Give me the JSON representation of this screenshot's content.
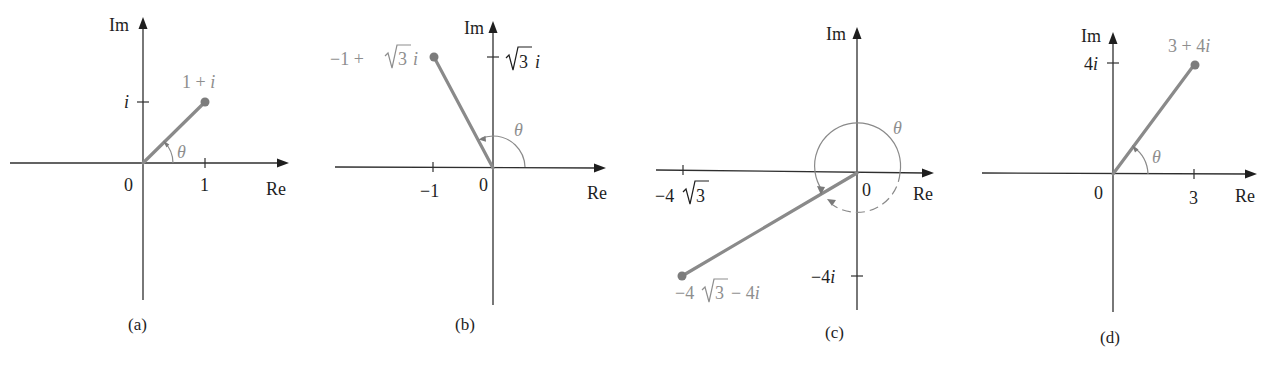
{
  "figure": {
    "colors": {
      "axis": "#2f2f2f",
      "vector": "#8a8a8a",
      "point": "#7c7c7c",
      "point_label": "#8e8e8e",
      "text": "#1e1e1e",
      "background": "#ffffff"
    },
    "axis_labels": {
      "real": "Re",
      "imaginary": "Im"
    },
    "angle_symbol": "θ",
    "panels": [
      {
        "caption": "(a)",
        "point_label": "1 + i",
        "complex_value": {
          "re": 1,
          "im": 1
        },
        "origin_label": "0",
        "re_tick_label": "1",
        "im_tick_label": "i"
      },
      {
        "caption": "(b)",
        "point_label_parts": [
          "−1 + ",
          "√",
          "3",
          " i"
        ],
        "complex_value": {
          "re": -1,
          "im": 1.732
        },
        "origin_label": "0",
        "re_tick_label": "−1",
        "im_tick_label_parts": [
          "√",
          "3",
          " i"
        ]
      },
      {
        "caption": "(c)",
        "point_label_parts": [
          "−4 ",
          "√",
          "3",
          " − 4i"
        ],
        "complex_value": {
          "re": -6.928,
          "im": -4
        },
        "origin_label": "0",
        "re_tick_label_parts": [
          "−4 ",
          "√",
          "3"
        ],
        "im_tick_label": "−4i"
      },
      {
        "caption": "(d)",
        "point_label": "3 + 4i",
        "complex_value": {
          "re": 3,
          "im": 4
        },
        "origin_label": "0",
        "re_tick_label": "3",
        "im_tick_label": "4i"
      }
    ]
  }
}
